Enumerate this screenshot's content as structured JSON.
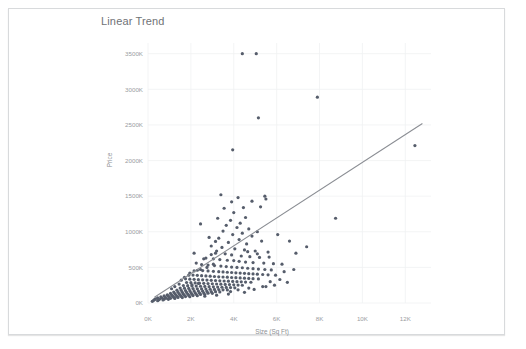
{
  "chart_data": {
    "type": "scatter",
    "title": "Linear Trend",
    "xlabel": "Size (Sq Ft)",
    "ylabel": "Price",
    "xlim": [
      0,
      13200
    ],
    "ylim": [
      0,
      3650000
    ],
    "grid": true,
    "legend": false,
    "x_ticks": [
      "0K",
      "2K",
      "4K",
      "6K",
      "8K",
      "10K",
      "12K"
    ],
    "x_tick_values": [
      0,
      2000,
      4000,
      6000,
      8000,
      10000,
      12000
    ],
    "y_ticks": [
      "0K",
      "500K",
      "1000K",
      "1500K",
      "2000K",
      "2500K",
      "3000K",
      "3500K"
    ],
    "y_tick_values": [
      0,
      500000,
      1000000,
      1500000,
      2000000,
      2500000,
      3000000,
      3500000
    ],
    "trendline": {
      "label": "Linear Trend",
      "x0": 300,
      "y0": 80000,
      "x1": 12800,
      "y1": 2520000,
      "color": "#8a8d93"
    },
    "marker_color": "#565d6b",
    "marker_size": 1.6,
    "series": [
      {
        "name": "Homes",
        "points": [
          [
            4400,
            3500000
          ],
          [
            5050,
            3500000
          ],
          [
            7900,
            2890000
          ],
          [
            5150,
            2600000
          ],
          [
            3950,
            2150000
          ],
          [
            12450,
            2210000
          ],
          [
            3400,
            1520000
          ],
          [
            5450,
            1500000
          ],
          [
            4200,
            1480000
          ],
          [
            5500,
            1460000
          ],
          [
            8750,
            1190000
          ],
          [
            4000,
            1270000
          ],
          [
            4550,
            1200000
          ],
          [
            3850,
            1160000
          ],
          [
            4300,
            1120000
          ],
          [
            3650,
            1090000
          ],
          [
            4150,
            1060000
          ],
          [
            4700,
            1040000
          ],
          [
            3500,
            1010000
          ],
          [
            5100,
            1000000
          ],
          [
            4400,
            980000
          ],
          [
            3950,
            960000
          ],
          [
            4850,
            940000
          ],
          [
            3300,
            910000
          ],
          [
            4250,
            890000
          ],
          [
            5300,
            870000
          ],
          [
            3750,
            850000
          ],
          [
            4600,
            830000
          ],
          [
            6050,
            960000
          ],
          [
            6600,
            870000
          ],
          [
            7400,
            790000
          ],
          [
            6900,
            700000
          ],
          [
            2950,
            800000
          ],
          [
            3450,
            780000
          ],
          [
            4050,
            760000
          ],
          [
            4500,
            745000
          ],
          [
            5000,
            730000
          ],
          [
            5600,
            715000
          ],
          [
            3150,
            700000
          ],
          [
            3600,
            690000
          ],
          [
            3900,
            675000
          ],
          [
            4350,
            660000
          ],
          [
            4750,
            650000
          ],
          [
            5200,
            640000
          ],
          [
            2700,
            630000
          ],
          [
            3050,
            620000
          ],
          [
            3350,
            610000
          ],
          [
            3700,
            600000
          ],
          [
            4000,
            595000
          ],
          [
            4250,
            585000
          ],
          [
            4550,
            575000
          ],
          [
            4900,
            568000
          ],
          [
            5400,
            560000
          ],
          [
            5850,
            552000
          ],
          [
            6250,
            545000
          ],
          [
            2500,
            540000
          ],
          [
            2800,
            532000
          ],
          [
            3100,
            525000
          ],
          [
            3400,
            518000
          ],
          [
            3650,
            512000
          ],
          [
            3900,
            505000
          ],
          [
            4150,
            500000
          ],
          [
            4400,
            495000
          ],
          [
            4650,
            488000
          ],
          [
            4900,
            482000
          ],
          [
            5150,
            476000
          ],
          [
            5450,
            470000
          ],
          [
            5750,
            465000
          ],
          [
            2300,
            460000
          ],
          [
            2550,
            455000
          ],
          [
            2800,
            450000
          ],
          [
            3050,
            445000
          ],
          [
            3300,
            440000
          ],
          [
            3500,
            436000
          ],
          [
            3700,
            432000
          ],
          [
            3900,
            428000
          ],
          [
            4100,
            424000
          ],
          [
            4300,
            420000
          ],
          [
            4500,
            416000
          ],
          [
            4700,
            412000
          ],
          [
            4900,
            408000
          ],
          [
            5100,
            404000
          ],
          [
            5350,
            400000
          ],
          [
            5600,
            396000
          ],
          [
            2100,
            392000
          ],
          [
            2300,
            388000
          ],
          [
            2500,
            384000
          ],
          [
            2700,
            380000
          ],
          [
            2900,
            376000
          ],
          [
            3100,
            372000
          ],
          [
            3300,
            368000
          ],
          [
            3500,
            365000
          ],
          [
            3700,
            362000
          ],
          [
            3900,
            358000
          ],
          [
            4100,
            355000
          ],
          [
            4300,
            352000
          ],
          [
            4500,
            348000
          ],
          [
            4700,
            345000
          ],
          [
            4900,
            342000
          ],
          [
            5150,
            338000
          ],
          [
            1950,
            335000
          ],
          [
            2150,
            332000
          ],
          [
            2350,
            328000
          ],
          [
            2550,
            325000
          ],
          [
            2750,
            322000
          ],
          [
            2950,
            318000
          ],
          [
            3150,
            315000
          ],
          [
            3350,
            312000
          ],
          [
            3550,
            309000
          ],
          [
            3750,
            306000
          ],
          [
            3950,
            303000
          ],
          [
            4150,
            300000
          ],
          [
            4350,
            297000
          ],
          [
            4550,
            294000
          ],
          [
            4800,
            291000
          ],
          [
            1800,
            288000
          ],
          [
            2000,
            285000
          ],
          [
            2200,
            282000
          ],
          [
            2400,
            279000
          ],
          [
            2600,
            276000
          ],
          [
            2800,
            273000
          ],
          [
            3000,
            270000
          ],
          [
            3200,
            267000
          ],
          [
            3400,
            264000
          ],
          [
            3600,
            261000
          ],
          [
            3800,
            258000
          ],
          [
            4000,
            255000
          ],
          [
            4200,
            252000
          ],
          [
            4400,
            249000
          ],
          [
            1650,
            246000
          ],
          [
            1850,
            243000
          ],
          [
            2050,
            240000
          ],
          [
            2250,
            238000
          ],
          [
            2450,
            235000
          ],
          [
            2650,
            232000
          ],
          [
            2850,
            229000
          ],
          [
            3050,
            227000
          ],
          [
            3250,
            224000
          ],
          [
            3450,
            221000
          ],
          [
            3650,
            219000
          ],
          [
            3850,
            216000
          ],
          [
            4050,
            213000
          ],
          [
            1500,
            210000
          ],
          [
            1700,
            208000
          ],
          [
            1900,
            205000
          ],
          [
            2100,
            203000
          ],
          [
            2300,
            200000
          ],
          [
            2500,
            198000
          ],
          [
            2700,
            195000
          ],
          [
            2900,
            193000
          ],
          [
            3100,
            190000
          ],
          [
            3300,
            188000
          ],
          [
            3500,
            185000
          ],
          [
            3700,
            183000
          ],
          [
            1350,
            180000
          ],
          [
            1550,
            178000
          ],
          [
            1750,
            175000
          ],
          [
            1950,
            173000
          ],
          [
            2150,
            170000
          ],
          [
            2350,
            168000
          ],
          [
            2550,
            166000
          ],
          [
            2750,
            163000
          ],
          [
            2950,
            161000
          ],
          [
            3150,
            159000
          ],
          [
            3350,
            156000
          ],
          [
            1200,
            154000
          ],
          [
            1400,
            152000
          ],
          [
            1600,
            150000
          ],
          [
            1800,
            148000
          ],
          [
            2000,
            146000
          ],
          [
            2200,
            144000
          ],
          [
            2400,
            142000
          ],
          [
            2600,
            140000
          ],
          [
            2800,
            138000
          ],
          [
            3000,
            136000
          ],
          [
            1050,
            134000
          ],
          [
            1250,
            132000
          ],
          [
            1450,
            130000
          ],
          [
            1650,
            128000
          ],
          [
            1850,
            126000
          ],
          [
            2050,
            124000
          ],
          [
            2250,
            122000
          ],
          [
            2450,
            120000
          ],
          [
            2650,
            118000
          ],
          [
            900,
            116000
          ],
          [
            1100,
            114000
          ],
          [
            1300,
            112000
          ],
          [
            1500,
            110000
          ],
          [
            1700,
            108000
          ],
          [
            1900,
            106000
          ],
          [
            2100,
            104000
          ],
          [
            2300,
            102000
          ],
          [
            750,
            100000
          ],
          [
            950,
            98000
          ],
          [
            1150,
            96000
          ],
          [
            1350,
            94000
          ],
          [
            1550,
            92000
          ],
          [
            1750,
            90000
          ],
          [
            1950,
            88000
          ],
          [
            600,
            86000
          ],
          [
            800,
            84000
          ],
          [
            1000,
            82000
          ],
          [
            1200,
            80000
          ],
          [
            1400,
            78000
          ],
          [
            1600,
            76000
          ],
          [
            450,
            72000
          ],
          [
            650,
            70000
          ],
          [
            850,
            68000
          ],
          [
            1050,
            66000
          ],
          [
            1250,
            64000
          ],
          [
            350,
            58000
          ],
          [
            550,
            56000
          ],
          [
            750,
            54000
          ],
          [
            950,
            52000
          ],
          [
            300,
            46000
          ],
          [
            500,
            44000
          ],
          [
            700,
            42000
          ],
          [
            250,
            34000
          ],
          [
            450,
            32000
          ],
          [
            200,
            24000
          ],
          [
            6350,
            440000
          ],
          [
            6800,
            470000
          ],
          [
            5950,
            390000
          ],
          [
            6150,
            330000
          ],
          [
            5700,
            300000
          ],
          [
            6500,
            290000
          ],
          [
            5900,
            250000
          ],
          [
            5500,
            230000
          ],
          [
            4700,
            210000
          ],
          [
            4200,
            185000
          ],
          [
            3850,
            160000
          ],
          [
            2250,
            560000
          ],
          [
            2600,
            620000
          ],
          [
            2950,
            680000
          ],
          [
            3200,
            730000
          ],
          [
            2450,
            470000
          ],
          [
            2750,
            500000
          ],
          [
            3050,
            545000
          ],
          [
            1950,
            420000
          ],
          [
            2150,
            450000
          ],
          [
            1700,
            360000
          ],
          [
            1900,
            390000
          ],
          [
            1550,
            320000
          ],
          [
            1750,
            340000
          ],
          [
            2350,
            275000
          ],
          [
            2050,
            255000
          ],
          [
            1450,
            265000
          ],
          [
            1250,
            230000
          ],
          [
            1100,
            200000
          ],
          [
            3150,
            865000
          ],
          [
            2850,
            920000
          ],
          [
            3550,
            1330000
          ],
          [
            3250,
            1190000
          ],
          [
            4850,
            1430000
          ],
          [
            5250,
            1350000
          ],
          [
            4450,
            1340000
          ],
          [
            3900,
            1420000
          ],
          [
            2450,
            1110000
          ],
          [
            2150,
            700000
          ],
          [
            5650,
            645000
          ],
          [
            5100,
            690000
          ],
          [
            4650,
            720000
          ],
          [
            5350,
            230000
          ],
          [
            4950,
            190000
          ],
          [
            4500,
            150000
          ],
          [
            3750,
            125000
          ],
          [
            3200,
            110000
          ],
          [
            2650,
            95000
          ]
        ]
      }
    ]
  }
}
